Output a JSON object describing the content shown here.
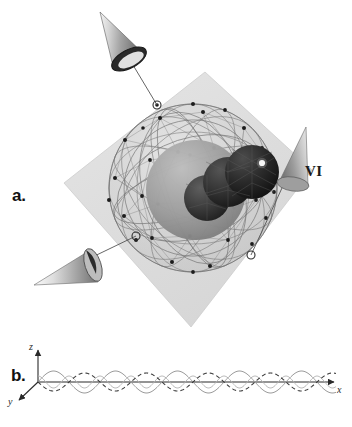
{
  "figure": {
    "background_color": "#ffffff",
    "width": 352,
    "height": 427
  },
  "panel_a": {
    "label": "a.",
    "annotation_label": "VI",
    "plane": {
      "name": "transparent-plane",
      "fill_color": "#dcdcdc",
      "stroke_color": "#c8c8c8",
      "corners": [
        [
          205,
          72
        ],
        [
          312,
          170
        ],
        [
          191,
          327
        ],
        [
          64,
          183
        ]
      ]
    },
    "outer_shell": {
      "name": "wireframe-sphere",
      "center": [
        193,
        188
      ],
      "radius": 84,
      "stroke_color": "#6e6e6e",
      "vertex_color": "#1c1c1c",
      "fill_color": "#cfcfcf",
      "fill_opacity": 0.3
    },
    "mid_shell": {
      "name": "mid-gray-sphere",
      "center": [
        196,
        190
      ],
      "radius": 50,
      "fill_color": "#9a9a9a"
    },
    "core_spheres": [
      {
        "name": "core-sphere-left",
        "center": [
          207,
          198
        ],
        "radius": 23,
        "fill_color": "#3a3a3a"
      },
      {
        "name": "core-sphere-middle",
        "center": [
          228,
          182
        ],
        "radius": 25,
        "fill_color": "#2e2e2e"
      },
      {
        "name": "core-sphere-right",
        "center": [
          252,
          172
        ],
        "radius": 27,
        "fill_color": "#242424",
        "highlight": {
          "center": [
            262,
            163
          ],
          "radius": 3,
          "color": "#f2f2f2"
        }
      }
    ],
    "cones": [
      {
        "name": "cone-top-left",
        "apex": [
          100,
          12
        ],
        "base_center": [
          128,
          47
        ],
        "base_rx": 18,
        "base_ry": 9,
        "rotation": -38
      },
      {
        "name": "cone-bottom-left",
        "apex": [
          34,
          285
        ],
        "base_center": [
          80,
          266
        ],
        "base_rx": 17,
        "base_ry": 10,
        "rotation": 22
      },
      {
        "name": "cone-right",
        "apex": [
          306,
          127
        ],
        "base_center": [
          291,
          176
        ],
        "base_rx": 17,
        "base_ry": 11,
        "rotation": 160
      }
    ],
    "leader_lines": [
      {
        "name": "leader-line-top",
        "from": [
          124,
          50
        ],
        "to": [
          157,
          105
        ]
      },
      {
        "name": "leader-line-bottom",
        "from": [
          80,
          263
        ],
        "to": [
          136,
          236
        ]
      },
      {
        "name": "leader-line-right",
        "from": [
          288,
          175
        ],
        "to": [
          251,
          255
        ]
      }
    ],
    "site_markers": [
      {
        "name": "site-marker-top",
        "center": [
          157,
          105
        ],
        "radius": 4
      },
      {
        "name": "site-marker-bottom",
        "center": [
          136,
          236
        ],
        "radius": 4
      },
      {
        "name": "site-marker-right",
        "center": [
          251,
          255
        ],
        "radius": 4
      }
    ]
  },
  "panel_b": {
    "label": "b.",
    "axes": {
      "x_label": "x",
      "y_label": "y",
      "z_label": "z",
      "origin": [
        38,
        382
      ],
      "x_end": [
        336,
        382
      ],
      "z_end": [
        38,
        348
      ],
      "y_end": [
        16,
        403
      ],
      "stroke_color": "#2a2a2a"
    },
    "curves": [
      {
        "name": "solid-helix-curve",
        "style": "solid",
        "stroke_color": "#9b9b9b",
        "amplitude": 11,
        "wavelength": 62,
        "phase": 0
      },
      {
        "name": "dashed-helix-curve",
        "style": "dashed",
        "stroke_color": "#3a3a3a",
        "amplitude": 9,
        "wavelength": 62,
        "phase": 3.14159
      },
      {
        "name": "solid-envelope-curve",
        "style": "solid",
        "stroke_color": "#b4b4b4",
        "amplitude": 6,
        "wavelength": 31,
        "phase": 1.5708
      }
    ],
    "x_range": [
      38,
      336
    ],
    "baseline_y": 382
  }
}
